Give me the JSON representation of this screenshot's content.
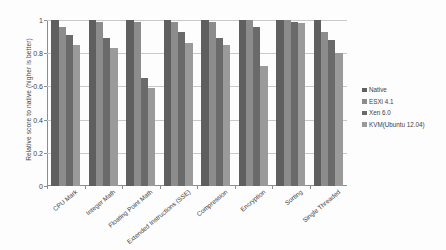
{
  "chart_data": {
    "type": "bar",
    "title": "",
    "xlabel": "",
    "ylabel": "Relative score to native (higher is better)",
    "ylim": [
      0,
      1
    ],
    "grid": true,
    "legend_position": "right",
    "categories": [
      "CPU Mark",
      "Integer Math",
      "Floating Point Math",
      "Extended Instructions (SSE)",
      "Compression",
      "Encryption",
      "Sorting",
      "Single Threaded"
    ],
    "y_ticks": [
      "0",
      "0.2",
      "0.4",
      "0.6",
      "0.8",
      "1"
    ],
    "y_tick_values": [
      0,
      0.2,
      0.4,
      0.6,
      0.8,
      1
    ],
    "series": [
      {
        "name": "Native",
        "color": "#5f5f5f",
        "values": [
          1.0,
          1.0,
          1.0,
          1.0,
          1.0,
          1.0,
          1.0,
          1.0
        ]
      },
      {
        "name": "ESXi 4.1",
        "color": "#8c8c8c",
        "values": [
          0.96,
          0.99,
          0.99,
          0.99,
          0.99,
          1.0,
          1.0,
          0.93
        ]
      },
      {
        "name": "Xen 6.0",
        "color": "#6a6a6a",
        "values": [
          0.91,
          0.89,
          0.65,
          0.93,
          0.89,
          0.96,
          0.99,
          0.88
        ]
      },
      {
        "name": "KVM(Ubuntu 12.04)",
        "color": "#9a9a9a",
        "values": [
          0.85,
          0.83,
          0.59,
          0.86,
          0.85,
          0.72,
          0.98,
          0.8
        ]
      }
    ]
  }
}
